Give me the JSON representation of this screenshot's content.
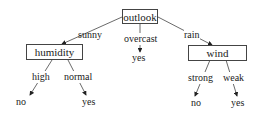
{
  "diagram": {
    "type": "decision-tree",
    "root": {
      "label": "outlook"
    },
    "nodes": {
      "outlook": "outlook",
      "humidity": "humidity",
      "wind": "wind"
    },
    "edges": {
      "sunny": "sunny",
      "overcast": "overcast",
      "rain": "rain",
      "high": "high",
      "normal": "normal",
      "strong": "strong",
      "weak": "weak"
    },
    "leaves": {
      "overcast_yes": "yes",
      "high_no": "no",
      "normal_yes": "yes",
      "strong_no": "no",
      "weak_yes": "yes"
    }
  },
  "colors": {
    "line": "#444444",
    "text": "#222222",
    "background": "#ffffff"
  }
}
